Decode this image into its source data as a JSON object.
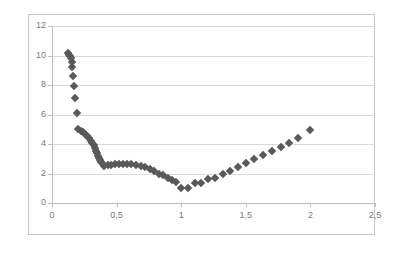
{
  "chart_data": {
    "type": "scatter",
    "title": "",
    "xlabel": "",
    "ylabel": "",
    "xlim": [
      0,
      2.5
    ],
    "ylim": [
      0,
      12
    ],
    "grid": true,
    "legend": false,
    "marker": "diamond",
    "marker_color": "#595959",
    "decimal_separator": ",",
    "x_ticks": [
      0,
      0.5,
      1,
      1.5,
      2,
      2.5
    ],
    "x_tick_labels": [
      "0",
      "0,5",
      "1",
      "1,5",
      "2",
      "2,5"
    ],
    "y_ticks": [
      0,
      2,
      4,
      6,
      8,
      10,
      12
    ],
    "y_tick_labels": [
      "0",
      "2",
      "4",
      "6",
      "8",
      "10",
      "12"
    ],
    "series": [
      {
        "name": "series-1",
        "points": [
          [
            0.125,
            10.15
          ],
          [
            0.132,
            10.05
          ],
          [
            0.138,
            9.95
          ],
          [
            0.145,
            9.8
          ],
          [
            0.152,
            9.55
          ],
          [
            0.158,
            9.2
          ],
          [
            0.165,
            8.6
          ],
          [
            0.172,
            7.95
          ],
          [
            0.18,
            7.15
          ],
          [
            0.19,
            6.1
          ],
          [
            0.205,
            5.05
          ],
          [
            0.222,
            4.9
          ],
          [
            0.24,
            4.78
          ],
          [
            0.258,
            4.65
          ],
          [
            0.272,
            4.52
          ],
          [
            0.288,
            4.38
          ],
          [
            0.3,
            4.22
          ],
          [
            0.312,
            4.05
          ],
          [
            0.322,
            3.9
          ],
          [
            0.332,
            3.72
          ],
          [
            0.342,
            3.55
          ],
          [
            0.35,
            3.38
          ],
          [
            0.358,
            3.22
          ],
          [
            0.366,
            3.05
          ],
          [
            0.374,
            2.9
          ],
          [
            0.382,
            2.78
          ],
          [
            0.392,
            2.66
          ],
          [
            0.405,
            2.52
          ],
          [
            0.43,
            2.55
          ],
          [
            0.46,
            2.58
          ],
          [
            0.49,
            2.62
          ],
          [
            0.52,
            2.65
          ],
          [
            0.55,
            2.65
          ],
          [
            0.58,
            2.66
          ],
          [
            0.615,
            2.62
          ],
          [
            0.65,
            2.58
          ],
          [
            0.685,
            2.5
          ],
          [
            0.72,
            2.42
          ],
          [
            0.755,
            2.3
          ],
          [
            0.79,
            2.2
          ],
          [
            0.825,
            2.0
          ],
          [
            0.86,
            1.88
          ],
          [
            0.895,
            1.7
          ],
          [
            0.925,
            1.55
          ],
          [
            0.96,
            1.4
          ],
          [
            1.0,
            1.02
          ],
          [
            1.055,
            1.0
          ],
          [
            1.105,
            1.35
          ],
          [
            1.155,
            1.38
          ],
          [
            1.205,
            1.62
          ],
          [
            1.265,
            1.72
          ],
          [
            1.32,
            1.95
          ],
          [
            1.38,
            2.2
          ],
          [
            1.44,
            2.45
          ],
          [
            1.505,
            2.7
          ],
          [
            1.565,
            2.95
          ],
          [
            1.63,
            3.25
          ],
          [
            1.7,
            3.55
          ],
          [
            1.77,
            3.82
          ],
          [
            1.835,
            4.05
          ],
          [
            1.905,
            4.4
          ],
          [
            2.0,
            4.95
          ]
        ]
      }
    ]
  },
  "frame": {
    "border_color": "#c8c8c8",
    "background": "#ffffff"
  }
}
